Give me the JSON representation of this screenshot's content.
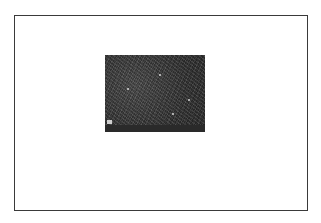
{
  "figure": {
    "frame_color": "#3a3a3a",
    "background": "#ffffff"
  },
  "micrograph": {
    "type": "SEM micrograph",
    "info_bar_left": "",
    "info_bar_right": ""
  }
}
